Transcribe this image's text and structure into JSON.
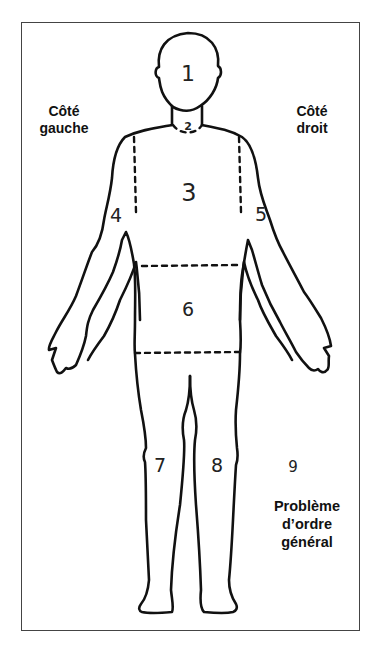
{
  "labels": {
    "left_side": [
      "Côté",
      "gauche"
    ],
    "right_side": [
      "Côté",
      "droit"
    ],
    "general": [
      "Problème",
      "d’ordre",
      "général"
    ]
  },
  "regions": [
    {
      "id": "1",
      "area": "head"
    },
    {
      "id": "2",
      "area": "neck"
    },
    {
      "id": "3",
      "area": "chest"
    },
    {
      "id": "4",
      "area": "left-arm"
    },
    {
      "id": "5",
      "area": "right-arm"
    },
    {
      "id": "6",
      "area": "abdomen"
    },
    {
      "id": "7",
      "area": "left-leg"
    },
    {
      "id": "8",
      "area": "right-leg"
    },
    {
      "id": "9",
      "area": "general"
    }
  ],
  "colors": {
    "outline": "#111111",
    "frame": "#444444",
    "background": "#ffffff"
  }
}
